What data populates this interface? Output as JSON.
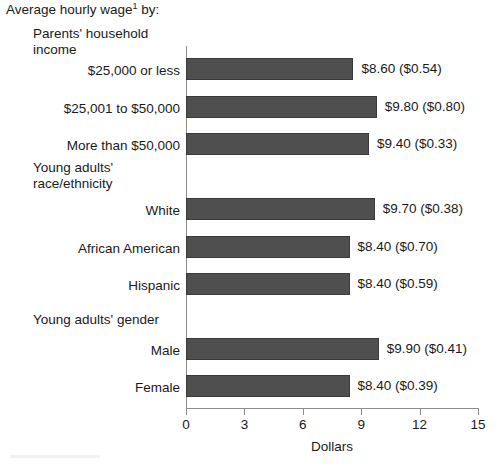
{
  "chart_data": {
    "type": "bar",
    "orientation": "horizontal",
    "title": "Average hourly wage",
    "title_superscript": "1",
    "title_suffix": " by:",
    "xlabel": "Dollars",
    "ylabel": "",
    "xlim": [
      0,
      15
    ],
    "xticks": [
      0,
      3,
      6,
      9,
      12,
      15
    ],
    "xtick_labels": [
      "0",
      "3",
      "6",
      "9",
      "12",
      "15"
    ],
    "grid": false,
    "legend": null,
    "bar_color": "#4f4f4f",
    "axis_color": "#8d8d8d",
    "groups": [
      {
        "heading": "Parents' household\nincome",
        "categories": [
          "$25,000 or less",
          "$25,001 to $50,000",
          "More than $50,000"
        ],
        "values": [
          8.6,
          9.8,
          9.4
        ],
        "errors": [
          0.54,
          0.8,
          0.33
        ],
        "data_labels": [
          "$8.60 ($0.54)",
          "$9.80 ($0.80)",
          "$9.40 ($0.33)"
        ]
      },
      {
        "heading": "Young adults'\nrace/ethnicity",
        "categories": [
          "White",
          "African American",
          "Hispanic"
        ],
        "values": [
          9.7,
          8.4,
          8.4
        ],
        "errors": [
          0.38,
          0.7,
          0.59
        ],
        "data_labels": [
          "$9.70 ($0.38)",
          "$8.40 ($0.70)",
          "$8.40 ($0.59)"
        ]
      },
      {
        "heading": "Young adults' gender",
        "categories": [
          "Male",
          "Female"
        ],
        "values": [
          9.9,
          8.4
        ],
        "errors": [
          0.41,
          0.39
        ],
        "data_labels": [
          "$9.90 ($0.41)",
          "$8.40 ($0.39)"
        ]
      }
    ]
  },
  "layout": {
    "heading_tops": [
      26,
      160,
      312
    ],
    "rows": [
      {
        "label": "$25,000 or less",
        "label_top": 63,
        "bar_top": 12,
        "value": 8.6,
        "data_label": "$8.60 ($0.54)"
      },
      {
        "label": "$25,001 to $50,000",
        "label_top": 101,
        "bar_top": 50,
        "value": 9.8,
        "data_label": "$9.80 ($0.80)"
      },
      {
        "label": "More than $50,000",
        "label_top": 138,
        "bar_top": 87,
        "value": 9.4,
        "data_label": "$9.40 ($0.33)"
      },
      {
        "label": "White",
        "label_top": 203,
        "bar_top": 152,
        "value": 9.7,
        "data_label": "$9.70 ($0.38)"
      },
      {
        "label": "African American",
        "label_top": 241,
        "bar_top": 190,
        "value": 8.4,
        "data_label": "$8.40 ($0.70)"
      },
      {
        "label": "Hispanic",
        "label_top": 278,
        "bar_top": 227,
        "value": 8.4,
        "data_label": "$8.40 ($0.59)"
      },
      {
        "label": "Male",
        "label_top": 343,
        "bar_top": 292,
        "value": 9.9,
        "data_label": "$9.90 ($0.41)"
      },
      {
        "label": "Female",
        "label_top": 380,
        "bar_top": 329,
        "value": 8.4,
        "data_label": "$8.40 ($0.39)"
      }
    ]
  }
}
